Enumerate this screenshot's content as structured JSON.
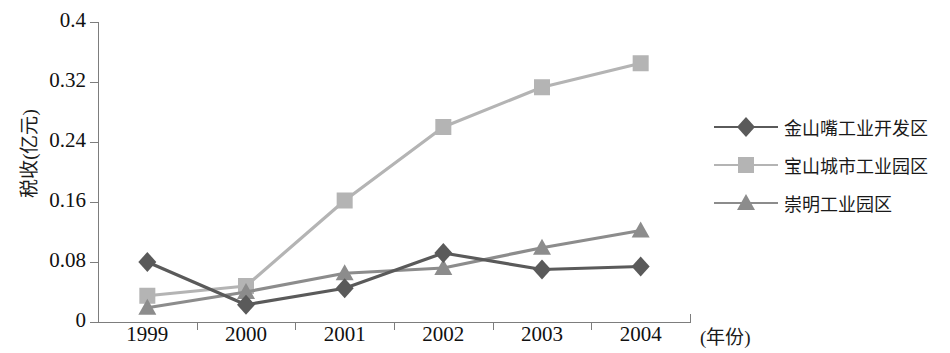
{
  "chart_data": {
    "type": "line",
    "title": "",
    "xlabel": "(年份)",
    "ylabel": "税收(亿元)",
    "categories": [
      "1999",
      "2000",
      "2001",
      "2002",
      "2003",
      "2004"
    ],
    "ylim": [
      0,
      0.4
    ],
    "yticks": [
      "0",
      "0.08",
      "0.16",
      "0.24",
      "0.32",
      "0.4"
    ],
    "ytick_values": [
      0,
      0.08,
      0.16,
      0.24,
      0.32,
      0.4
    ],
    "grid": false,
    "legend_position": "right",
    "series": [
      {
        "name": "金山嘴工业开发区",
        "marker": "diamond",
        "color": "#5a5a5a",
        "values": [
          0.08,
          0.023,
          0.045,
          0.092,
          0.07,
          0.074
        ]
      },
      {
        "name": "宝山城市工业园区",
        "marker": "square",
        "color": "#b4b4b4",
        "values": [
          0.035,
          0.048,
          0.162,
          0.26,
          0.313,
          0.345
        ]
      },
      {
        "name": "崇明工业园区",
        "marker": "triangle",
        "color": "#8c8c8c",
        "values": [
          0.019,
          0.04,
          0.065,
          0.072,
          0.099,
          0.122
        ]
      }
    ]
  }
}
